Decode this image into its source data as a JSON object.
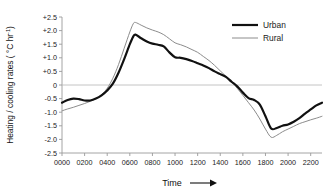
{
  "chart_data": {
    "type": "line",
    "title": "",
    "xlabel": "Time",
    "xlabel_arrow": "⟶",
    "ylabel": "Heating / cooling rates ( °C hr",
    "ylabel_exponent": "-1",
    "ylabel_close": ")",
    "grid": false,
    "zero_line": true,
    "legend_position": "top-right",
    "xlim": [
      0,
      2300
    ],
    "ylim": [
      -2.5,
      2.5
    ],
    "xtick_labels": [
      "0000",
      "0200",
      "0400",
      "0600",
      "0800",
      "1000",
      "1200",
      "1400",
      "1600",
      "1800",
      "2000",
      "2200"
    ],
    "xtick_values": [
      0,
      200,
      400,
      600,
      800,
      1000,
      1200,
      1400,
      1600,
      1800,
      2000,
      2200
    ],
    "ytick_labels": [
      "+2.5",
      "+2.0",
      "+1.5",
      "+1.0",
      "+0.5",
      "0",
      "-0.5",
      "-1.0",
      "-1.5",
      "-2.0",
      "-2.5"
    ],
    "ytick_values": [
      2.5,
      2.0,
      1.5,
      1.0,
      0.5,
      0,
      -0.5,
      -1.0,
      -1.5,
      -2.0,
      -2.5
    ],
    "x": [
      0,
      50,
      100,
      150,
      200,
      250,
      300,
      350,
      400,
      450,
      500,
      550,
      600,
      630,
      650,
      700,
      750,
      800,
      850,
      900,
      950,
      1000,
      1050,
      1100,
      1150,
      1200,
      1250,
      1300,
      1350,
      1400,
      1450,
      1500,
      1550,
      1600,
      1650,
      1700,
      1750,
      1800,
      1850,
      1900,
      1950,
      2000,
      2050,
      2100,
      2150,
      2200,
      2250,
      2300
    ],
    "series": [
      {
        "name": "Urban",
        "color": "#111111",
        "linewidth": 2.2,
        "values": [
          -0.65,
          -0.55,
          -0.5,
          -0.52,
          -0.57,
          -0.57,
          -0.5,
          -0.38,
          -0.2,
          0.05,
          0.45,
          0.95,
          1.5,
          1.78,
          1.85,
          1.72,
          1.6,
          1.52,
          1.48,
          1.42,
          1.2,
          1.02,
          1.0,
          0.95,
          0.88,
          0.8,
          0.72,
          0.62,
          0.5,
          0.4,
          0.3,
          0.12,
          -0.05,
          -0.28,
          -0.48,
          -0.55,
          -0.72,
          -1.15,
          -1.6,
          -1.58,
          -1.5,
          -1.45,
          -1.35,
          -1.22,
          -1.05,
          -0.9,
          -0.75,
          -0.65
        ]
      },
      {
        "name": "Rural",
        "color": "#8c8c8c",
        "linewidth": 1.0,
        "values": [
          -0.95,
          -0.88,
          -0.82,
          -0.75,
          -0.68,
          -0.6,
          -0.5,
          -0.35,
          -0.12,
          0.25,
          0.75,
          1.35,
          1.95,
          2.25,
          2.3,
          2.2,
          2.1,
          2.02,
          1.95,
          1.85,
          1.7,
          1.55,
          1.48,
          1.4,
          1.3,
          1.2,
          1.05,
          0.9,
          0.72,
          0.52,
          0.32,
          0.12,
          -0.12,
          -0.38,
          -0.65,
          -0.92,
          -1.25,
          -1.62,
          -1.92,
          -1.85,
          -1.72,
          -1.62,
          -1.52,
          -1.42,
          -1.35,
          -1.28,
          -1.22,
          -1.15
        ]
      }
    ],
    "legend": [
      {
        "label": "Urban",
        "color": "#111111",
        "linewidth": 2.2
      },
      {
        "label": "Rural",
        "color": "#8c8c8c",
        "linewidth": 1.0
      }
    ]
  }
}
